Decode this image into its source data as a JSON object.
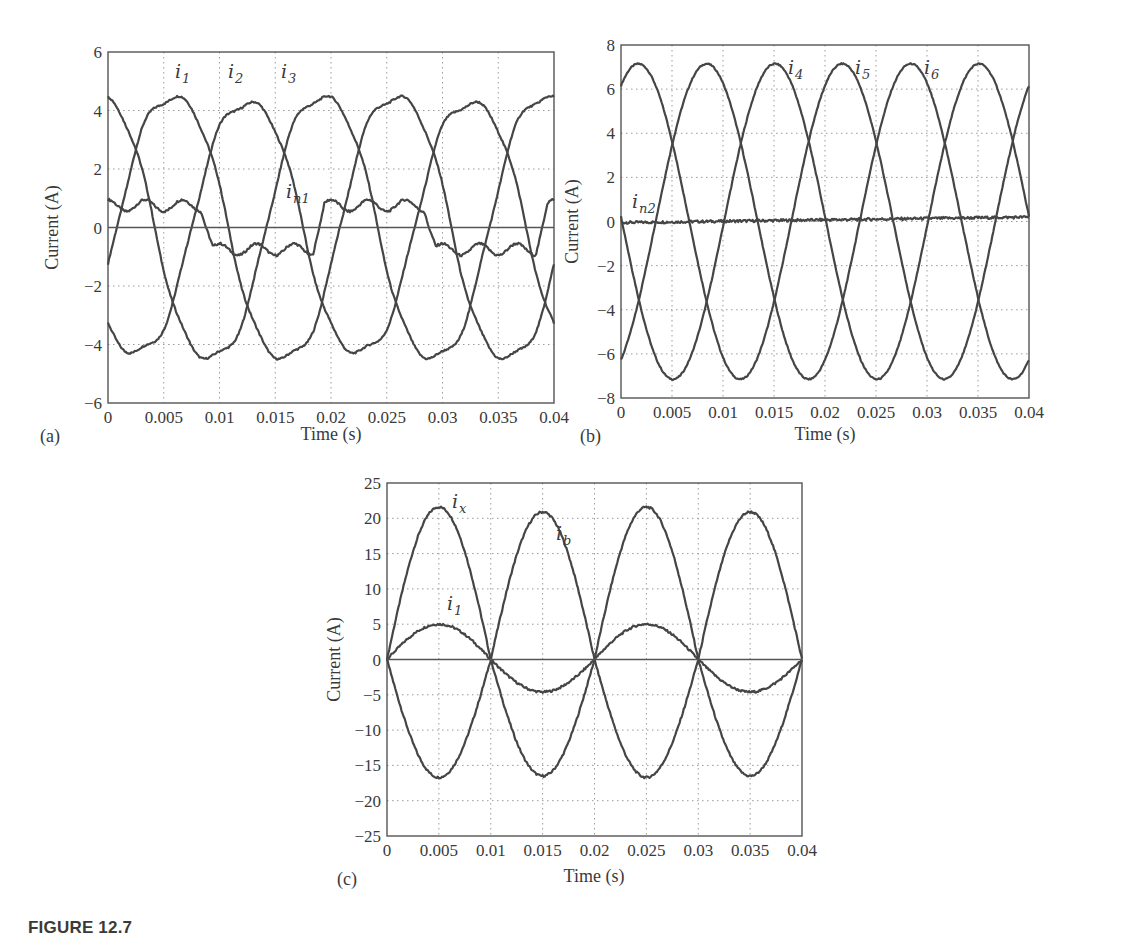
{
  "caption": "FIGURE 12.7",
  "chart_data": [
    {
      "type": "line",
      "panel": "(a)",
      "title": "",
      "xlabel": "Time (s)",
      "ylabel": "Current (A)",
      "xlim": [
        0,
        0.04
      ],
      "ylim": [
        -6,
        6
      ],
      "grid": true,
      "xticks": [
        "0",
        "0.005",
        "0.01",
        "0.015",
        "0.02",
        "0.025",
        "0.03",
        "0.035",
        "0.04"
      ],
      "yticks": [
        "6",
        "4",
        "2",
        "0",
        "−2",
        "−4",
        "−6"
      ],
      "frequency_hz": 50,
      "series": [
        {
          "name": "i1",
          "label_main": "i",
          "label_sub": "1",
          "amplitude": 4.7,
          "peak_time": 0.0058,
          "harmonic3": 0.35,
          "label_pos": [
            175,
            78
          ]
        },
        {
          "name": "i2",
          "label_main": "i",
          "label_sub": "2",
          "amplitude": 4.5,
          "peak_time": 0.0125,
          "harmonic3": 0.35,
          "label_pos": [
            228,
            78
          ]
        },
        {
          "name": "i3",
          "label_main": "i",
          "label_sub": "3",
          "amplitude": 4.7,
          "peak_time": 0.0192,
          "harmonic3": 0.35,
          "label_pos": [
            281,
            78
          ]
        },
        {
          "name": "in1",
          "label_main": "i",
          "label_sub": "n1",
          "type": "neutral",
          "amplitude": 0.75,
          "ripple": 0.2,
          "label_pos": [
            286,
            198
          ]
        },
        {
          "name": "zero",
          "type": "zero"
        }
      ],
      "sample_values": {
        "x": [
          0,
          0.005,
          0.01,
          0.015,
          0.02,
          0.025,
          0.03,
          0.035,
          0.04
        ],
        "i1": [
          -0.3,
          4.8,
          0.5,
          -4.8,
          -0.3,
          4.9,
          0.4,
          -4.9,
          -0.3
        ],
        "i2": [
          -3.3,
          -2.3,
          3.9,
          2.4,
          -3.6,
          -2.3,
          4.0,
          2.3,
          -3.1
        ],
        "i3": [
          4.5,
          -2.4,
          -4.4,
          2.3,
          4.5,
          -2.4,
          -4.4,
          2.2,
          4.6
        ],
        "in1": [
          0.8,
          0.6,
          -0.5,
          -0.7,
          0.8,
          0.6,
          -0.6,
          -0.8,
          0.9
        ]
      }
    },
    {
      "type": "line",
      "panel": "(b)",
      "title": "",
      "xlabel": "Time (s)",
      "ylabel": "Current (A)",
      "xlim": [
        0,
        0.04
      ],
      "ylim": [
        -8,
        8
      ],
      "grid": true,
      "xticks": [
        "0",
        "0.005",
        "0.01",
        "0.015",
        "0.02",
        "0.025",
        "0.03",
        "0.035",
        "0.04"
      ],
      "yticks": [
        "8",
        "6",
        "4",
        "2",
        "0",
        "−2",
        "−4",
        "−6",
        "−8"
      ],
      "frequency_hz": 50,
      "series": [
        {
          "name": "i4",
          "label_main": "i",
          "label_sub": "4",
          "amplitude": 7.15,
          "peak_time": 0.0017,
          "label_pos": [
            788,
            74
          ]
        },
        {
          "name": "i5",
          "label_main": "i",
          "label_sub": "5",
          "amplitude": 7.15,
          "peak_time": 0.0084,
          "label_pos": [
            855,
            74
          ]
        },
        {
          "name": "i6",
          "label_main": "i",
          "label_sub": "6",
          "amplitude": 7.15,
          "peak_time": 0.0151,
          "label_pos": [
            924,
            74
          ]
        },
        {
          "name": "in2",
          "label_main": "i",
          "label_sub": "n2",
          "type": "flat",
          "start": -0.05,
          "end": 0.2,
          "label_pos": [
            632,
            208
          ]
        }
      ],
      "sample_values": {
        "x": [
          0,
          0.005,
          0.01,
          0.015,
          0.02,
          0.025,
          0.03,
          0.035,
          0.04
        ],
        "i4": [
          6.2,
          3.5,
          -6.6,
          -3.7,
          6.2,
          3.7,
          -6.5,
          -3.6,
          6.2
        ],
        "i5": [
          -6.5,
          3.6,
          6.1,
          -3.6,
          -6.4,
          3.7,
          6.2,
          -3.5,
          -6.5
        ],
        "i6": [
          0.3,
          -7.0,
          0.4,
          7.1,
          0.2,
          -7.0,
          0.3,
          7.2,
          0.6
        ],
        "in2": [
          -0.05,
          0.0,
          0.05,
          0.08,
          0.05,
          0.08,
          0.12,
          0.18,
          0.15
        ]
      }
    },
    {
      "type": "line",
      "panel": "(c)",
      "title": "",
      "xlabel": "Time (s)",
      "ylabel": "Current (A)",
      "xlim": [
        0,
        0.04
      ],
      "ylim": [
        -25,
        25
      ],
      "grid": true,
      "xticks": [
        "0",
        "0.005",
        "0.01",
        "0.015",
        "0.02",
        "0.025",
        "0.03",
        "0.035",
        "0.04"
      ],
      "yticks": [
        "25",
        "20",
        "15",
        "10",
        "5",
        "0",
        "−5",
        "−10",
        "−15",
        "−20",
        "−25"
      ],
      "frequency_hz": 50,
      "series": [
        {
          "name": "ix",
          "label_main": "i",
          "label_sub": "x",
          "amplitude_pos": 21.6,
          "amplitude_neg": 16.5,
          "label_pos": [
            452,
            508
          ]
        },
        {
          "name": "ib",
          "label_main": "i",
          "label_sub": "b",
          "amplitude_pos": -16.7,
          "amplitude_neg": -20.9,
          "label_pos": [
            556,
            540
          ]
        },
        {
          "name": "i1",
          "label_main": "i",
          "label_sub": "1",
          "amplitude_pos": 5.0,
          "amplitude_neg": 4.6,
          "label_pos": [
            447,
            610
          ]
        },
        {
          "name": "zero",
          "type": "zero"
        }
      ],
      "sample_values": {
        "x": [
          0,
          0.005,
          0.01,
          0.015,
          0.02,
          0.025,
          0.03,
          0.035,
          0.04
        ],
        "ix": [
          0,
          21.5,
          0,
          -21.0,
          0,
          21.8,
          0,
          -20.8,
          0
        ],
        "ib": [
          0,
          -16.5,
          0,
          16.7,
          0,
          -16.3,
          0,
          16.9,
          0
        ],
        "i1": [
          0,
          4.9,
          0,
          -4.6,
          0,
          5.2,
          0,
          -4.5,
          0
        ]
      }
    }
  ],
  "layout": {
    "panels": [
      {
        "left": 108,
        "right": 554,
        "top": 52,
        "bottom": 403,
        "panel_label_pos": [
          40,
          442
        ],
        "xlabel_pos": [
          331,
          440
        ],
        "ylabel_x": 58
      },
      {
        "left": 621,
        "right": 1029,
        "top": 45,
        "bottom": 398,
        "panel_label_pos": [
          580,
          442
        ],
        "xlabel_pos": [
          825,
          440
        ],
        "ylabel_x": 578
      },
      {
        "left": 387,
        "right": 802,
        "top": 483,
        "bottom": 836,
        "panel_label_pos": [
          337,
          885
        ],
        "xlabel_pos": [
          594,
          882
        ],
        "ylabel_x": 340
      }
    ]
  }
}
